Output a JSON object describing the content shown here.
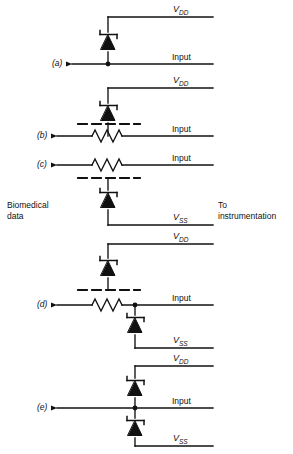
{
  "figure": {
    "type": "circuit-diagram",
    "width": 293,
    "height": 454,
    "stroke_color": "#111111",
    "background": "#ffffff"
  },
  "side_labels": {
    "left": "Biomedical\ndata",
    "right": "To\ninstrumentation"
  },
  "rails": {
    "vdd": "V",
    "vdd_sub": "DD",
    "vss": "V",
    "vss_sub": "SS",
    "input": "Input"
  },
  "panels": [
    {
      "id": "a",
      "letter": "(a)",
      "components": [
        "zener-diode-to-vdd"
      ],
      "rail_top": "VDD",
      "rail_bottom": null,
      "has_series_resistor": false,
      "has_dashed_line": false,
      "labels": {
        "supply_top": "V",
        "supply_top_sub": "DD",
        "input": "Input"
      }
    },
    {
      "id": "b",
      "letter": "(b)",
      "components": [
        "zener-diode-to-vdd",
        "series-resistor",
        "dashed-line"
      ],
      "rail_top": "VDD",
      "rail_bottom": null,
      "has_series_resistor": true,
      "has_dashed_line": true,
      "labels": {
        "supply_top": "V",
        "supply_top_sub": "DD",
        "input": "Input"
      }
    },
    {
      "id": "c",
      "letter": "(c)",
      "components": [
        "series-resistor",
        "dashed-line",
        "zener-diode-to-vss"
      ],
      "rail_top": null,
      "rail_bottom": "VSS",
      "has_series_resistor": true,
      "has_dashed_line": true,
      "labels": {
        "input": "Input",
        "supply_bottom": "V",
        "supply_bottom_sub": "SS"
      }
    },
    {
      "id": "d",
      "letter": "(d)",
      "components": [
        "zener-diode-to-vdd",
        "dashed-line",
        "series-resistor",
        "zener-diode-to-vss"
      ],
      "rail_top": "VDD",
      "rail_bottom": "VSS",
      "has_series_resistor": true,
      "has_dashed_line": true,
      "labels": {
        "supply_top": "V",
        "supply_top_sub": "DD",
        "input": "Input",
        "supply_bottom": "V",
        "supply_bottom_sub": "SS"
      }
    },
    {
      "id": "e",
      "letter": "(e)",
      "components": [
        "zener-diode-to-vdd",
        "zener-diode-to-vss"
      ],
      "rail_top": "VDD",
      "rail_bottom": "VSS",
      "has_series_resistor": false,
      "has_dashed_line": false,
      "labels": {
        "supply_top": "V",
        "supply_top_sub": "DD",
        "input": "Input",
        "supply_bottom": "V",
        "supply_bottom_sub": "SS"
      }
    }
  ]
}
